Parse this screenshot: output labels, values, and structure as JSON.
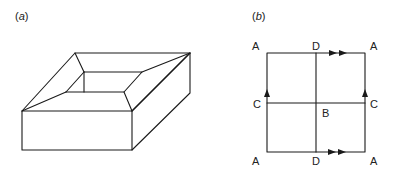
{
  "figure": {
    "panels": [
      {
        "id": "a",
        "label_open": "(",
        "label_letter": "a",
        "label_close": ")",
        "description": "Perspective view of a square frame (box with square hole), rendered as line drawing"
      },
      {
        "id": "b",
        "label_open": "(",
        "label_letter": "b",
        "label_close": ")",
        "description": "Square identification diagram divided into four quadrants with labeled edges",
        "points": {
          "top_left": "A",
          "top_mid": "D",
          "top_right": "A",
          "mid_left": "C",
          "center": "B",
          "mid_right": "C",
          "bottom_left": "A",
          "bottom_mid": "D",
          "bottom_right": "A"
        },
        "arrows": {
          "top_edge": "double-arrow right",
          "bottom_edge": "double-arrow right",
          "left_edge": "single-arrow up",
          "right_edge": "single-arrow up"
        }
      }
    ],
    "colors": {
      "line": "#1a1a1a",
      "background": "#ffffff"
    }
  }
}
